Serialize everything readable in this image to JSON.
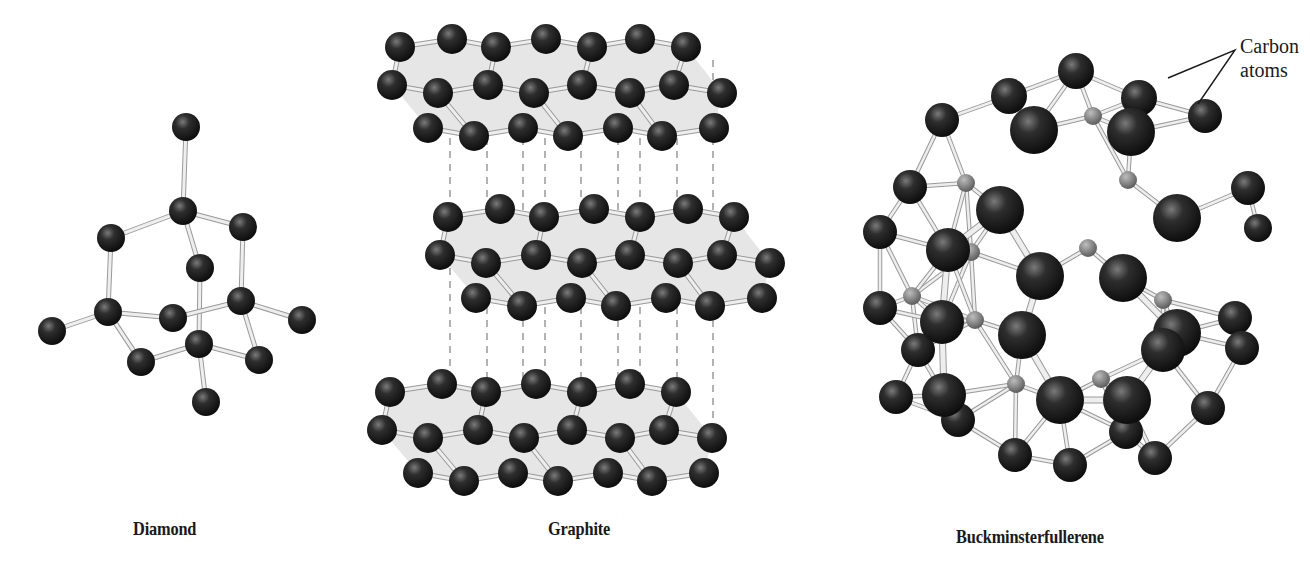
{
  "figure": {
    "background": "#ffffff",
    "atom_color": "#1e1e1e",
    "bond_color": "#d2d2d2",
    "sheet_color": "#e6e6e6",
    "dash_color": "#8a8a8a"
  },
  "panels": [
    {
      "id": "diamond",
      "caption": "Diamond",
      "caption_pos": [
        133,
        518
      ]
    },
    {
      "id": "graphite",
      "caption": "Graphite",
      "caption_pos": [
        548,
        518
      ]
    },
    {
      "id": "buckminsterfullerene",
      "caption": "Buckminsterfullerene",
      "caption_pos": [
        956,
        526
      ]
    }
  ],
  "callout": {
    "line1": "Carbon",
    "line2": "atoms",
    "pos": [
      1240,
      34
    ]
  },
  "diamond": {
    "atoms": [
      [
        186,
        127,
        14
      ],
      [
        183,
        211,
        14
      ],
      [
        111,
        238,
        14
      ],
      [
        243,
        227,
        14
      ],
      [
        200,
        268,
        14
      ],
      [
        108,
        312,
        14
      ],
      [
        173,
        318,
        14
      ],
      [
        241,
        301,
        14
      ],
      [
        52,
        331,
        14
      ],
      [
        302,
        320,
        14
      ],
      [
        141,
        362,
        14
      ],
      [
        199,
        344,
        14
      ],
      [
        259,
        360,
        14
      ],
      [
        206,
        402,
        14
      ]
    ],
    "bonds": [
      [
        0,
        1
      ],
      [
        1,
        2
      ],
      [
        1,
        3
      ],
      [
        1,
        4
      ],
      [
        2,
        5
      ],
      [
        3,
        7
      ],
      [
        4,
        11
      ],
      [
        5,
        8
      ],
      [
        5,
        6
      ],
      [
        5,
        10
      ],
      [
        6,
        7
      ],
      [
        7,
        9
      ],
      [
        7,
        12
      ],
      [
        10,
        11
      ],
      [
        11,
        12
      ],
      [
        11,
        13
      ]
    ]
  },
  "graphite": {
    "layers": [
      {
        "dy": 0
      },
      {
        "dy": 170
      },
      {
        "dy": 345
      }
    ],
    "rows": [
      {
        "y": 47,
        "x": [
          400,
          452,
          496,
          546,
          592,
          640,
          686
        ],
        "zig": [
          0,
          -8,
          0,
          -8,
          0,
          -8,
          0
        ]
      },
      {
        "y": 85,
        "x": [
          392,
          438,
          488,
          534,
          582,
          630,
          674,
          722
        ],
        "zig": [
          0,
          8,
          0,
          8,
          0,
          8,
          0,
          8
        ]
      },
      {
        "y": 128,
        "x": [
          428,
          474,
          523,
          568,
          618,
          662,
          714
        ],
        "zig": [
          0,
          8,
          0,
          8,
          0,
          8,
          0
        ]
      }
    ],
    "layer_offsets_x": [
      0,
      48,
      -10
    ],
    "dash_x": [
      450,
      487,
      523,
      545,
      581,
      618,
      640,
      677,
      713
    ]
  },
  "fullerene": {
    "front_atoms": [
      [
        1034,
        130,
        24
      ],
      [
        1131,
        132,
        24
      ],
      [
        1000,
        210,
        24
      ],
      [
        1177,
        218,
        24
      ],
      [
        948,
        250,
        22
      ],
      [
        1040,
        276,
        24
      ],
      [
        1123,
        278,
        24
      ],
      [
        942,
        322,
        22
      ],
      [
        1177,
        333,
        24
      ],
      [
        1022,
        335,
        24
      ],
      [
        944,
        395,
        22
      ],
      [
        1163,
        350,
        22
      ],
      [
        1060,
        400,
        24
      ],
      [
        1127,
        400,
        24
      ]
    ],
    "rim_atoms": [
      [
        1076,
        71,
        18
      ],
      [
        1009,
        96,
        18
      ],
      [
        1139,
        98,
        18
      ],
      [
        1205,
        116,
        17
      ],
      [
        942,
        120,
        17
      ],
      [
        910,
        187,
        17
      ],
      [
        1248,
        188,
        17
      ],
      [
        880,
        232,
        17
      ],
      [
        1258,
        228,
        14
      ],
      [
        880,
        308,
        17
      ],
      [
        1235,
        318,
        17
      ],
      [
        918,
        350,
        17
      ],
      [
        1242,
        348,
        17
      ],
      [
        896,
        397,
        17
      ],
      [
        958,
        420,
        17
      ],
      [
        1208,
        408,
        17
      ],
      [
        1015,
        455,
        17
      ],
      [
        1070,
        465,
        17
      ],
      [
        1126,
        432,
        17
      ],
      [
        1155,
        458,
        17
      ]
    ],
    "back_atoms": [
      [
        1093,
        116,
        9
      ],
      [
        966,
        183,
        9
      ],
      [
        1128,
        180,
        9
      ],
      [
        1088,
        248,
        9
      ],
      [
        971,
        252,
        9
      ],
      [
        1163,
        300,
        9
      ],
      [
        912,
        296,
        9
      ],
      [
        1101,
        379,
        9
      ],
      [
        1016,
        384,
        9
      ],
      [
        975,
        320,
        9
      ]
    ]
  }
}
